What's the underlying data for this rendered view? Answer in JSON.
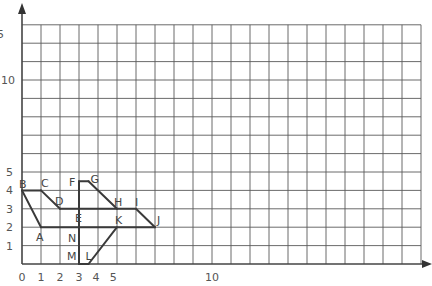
{
  "diagram": {
    "type": "coordinate-grid-figure",
    "grid": {
      "x_units": 21,
      "y_units": 13,
      "color": "#5a5a5a"
    },
    "axes": {
      "x_ticks": [
        {
          "label": "0",
          "value": 0
        },
        {
          "label": "1",
          "value": 1
        },
        {
          "label": "2",
          "value": 2
        },
        {
          "label": "3",
          "value": 3
        },
        {
          "label": "4",
          "value": 3.9
        },
        {
          "label": "5",
          "value": 4.8
        },
        {
          "label": "10",
          "value": 10
        }
      ],
      "y_ticks": [
        {
          "label": "1",
          "value": 1
        },
        {
          "label": "2",
          "value": 2
        },
        {
          "label": "3",
          "value": 3
        },
        {
          "label": "4",
          "value": 4
        },
        {
          "label": "5",
          "value": 5
        },
        {
          "label": "10",
          "value": 10
        },
        {
          "label": "15",
          "value": 15
        }
      ]
    },
    "points": [
      {
        "name": "A",
        "x": 1,
        "y": 2,
        "label_dx": -5,
        "label_dy": 14
      },
      {
        "name": "B",
        "x": 0,
        "y": 4,
        "label_dx": -3,
        "label_dy": -2
      },
      {
        "name": "C",
        "x": 1,
        "y": 4,
        "label_dx": 0,
        "label_dy": -3
      },
      {
        "name": "D",
        "x": 2,
        "y": 3,
        "label_dx": -5,
        "label_dy": -4
      },
      {
        "name": "E",
        "x": 3,
        "y": 3,
        "label_dx": -4,
        "label_dy": 13
      },
      {
        "name": "F",
        "x": 3,
        "y": 4.5,
        "label_dx": -10,
        "label_dy": 5
      },
      {
        "name": "G",
        "x": 3.5,
        "y": 4.5,
        "label_dx": 2,
        "label_dy": 2
      },
      {
        "name": "H",
        "x": 5,
        "y": 3,
        "label_dx": -3,
        "label_dy": -3
      },
      {
        "name": "I",
        "x": 6,
        "y": 3,
        "label_dx": -1,
        "label_dy": -3
      },
      {
        "name": "J",
        "x": 7,
        "y": 2,
        "label_dx": 2,
        "label_dy": -3
      },
      {
        "name": "K",
        "x": 5,
        "y": 2,
        "label_dx": -2,
        "label_dy": -3
      },
      {
        "name": "L",
        "x": 3.5,
        "y": 0,
        "label_dx": -3,
        "label_dy": -4
      },
      {
        "name": "M",
        "x": 3,
        "y": 0,
        "label_dx": -12,
        "label_dy": -4
      },
      {
        "name": "N",
        "x": 3,
        "y": 1.5,
        "label_dx": -11,
        "label_dy": 6
      }
    ],
    "segments": [
      [
        "B",
        "C"
      ],
      [
        "C",
        "D"
      ],
      [
        "D",
        "I"
      ],
      [
        "I",
        "J"
      ],
      [
        "J",
        "A"
      ],
      [
        "A",
        "B"
      ],
      [
        "F",
        "G"
      ],
      [
        "G",
        "H"
      ],
      [
        "F",
        "M"
      ],
      [
        "M",
        "L"
      ],
      [
        "L",
        "K"
      ]
    ]
  }
}
